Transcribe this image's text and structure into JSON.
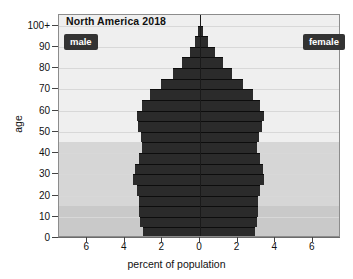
{
  "chart_data": {
    "type": "bar",
    "subtype": "population-pyramid",
    "title": "North America 2018",
    "xlabel": "percent of population",
    "ylabel": "age",
    "xlim": [
      -7.5,
      7.5
    ],
    "ylim": [
      0,
      105
    ],
    "grid": true,
    "legend_position": "inside-top-left-and-top-right",
    "xtick_labels": [
      "6",
      "4",
      "2",
      "0",
      "2",
      "4",
      "6"
    ],
    "xtick_values": [
      -6,
      -4,
      -2,
      0,
      2,
      4,
      6
    ],
    "ytick_labels": [
      "0",
      "10",
      "20",
      "30",
      "40",
      "50",
      "60",
      "70",
      "80",
      "90",
      "100+"
    ],
    "ytick_values": [
      0,
      10,
      20,
      30,
      40,
      50,
      60,
      70,
      80,
      90,
      100
    ],
    "age_groups": [
      "0-4",
      "5-9",
      "10-14",
      "15-19",
      "20-24",
      "25-29",
      "30-34",
      "35-39",
      "40-44",
      "45-49",
      "50-54",
      "55-59",
      "60-64",
      "65-69",
      "70-74",
      "75-79",
      "80-84",
      "85-89",
      "90-94",
      "95-99",
      "100+"
    ],
    "series": [
      {
        "name": "male",
        "side": "left",
        "color": "#2b2b2b",
        "values": [
          3.05,
          3.2,
          3.25,
          3.25,
          3.35,
          3.55,
          3.45,
          3.25,
          3.1,
          3.15,
          3.3,
          3.35,
          3.1,
          2.65,
          2.1,
          1.45,
          0.95,
          0.55,
          0.25,
          0.08,
          0.02
        ]
      },
      {
        "name": "female",
        "side": "right",
        "color": "#2b2b2b",
        "values": [
          2.9,
          3.05,
          3.1,
          3.1,
          3.2,
          3.4,
          3.35,
          3.2,
          3.05,
          3.15,
          3.3,
          3.4,
          3.2,
          2.8,
          2.3,
          1.7,
          1.2,
          0.8,
          0.42,
          0.15,
          0.04
        ]
      }
    ],
    "background_bands": [
      {
        "label": "youth",
        "age_from": 0,
        "age_to": 15,
        "color": "#c9c9c9"
      },
      {
        "label": "working-age",
        "age_from": 15,
        "age_to": 45,
        "color": "#d6d6d6"
      },
      {
        "label": "older",
        "age_from": 45,
        "age_to": 105,
        "color": "#efefef"
      }
    ]
  },
  "legend": {
    "male_label": "male",
    "female_label": "female"
  }
}
